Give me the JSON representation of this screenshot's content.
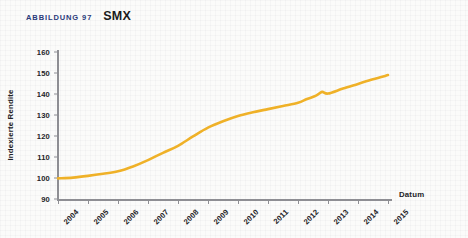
{
  "figure": {
    "kicker": "ABBILDUNG 97",
    "title": "SMX"
  },
  "colors": {
    "series": "#efb128",
    "kicker": "#2b3a7a",
    "axis": "#8e8e93",
    "text": "#232327",
    "background": "#fbfbfa"
  },
  "chart_data": {
    "type": "line",
    "title": "SMX",
    "xlabel": "Datum",
    "ylabel": "Indexierte Rendite",
    "xlim": [
      2004,
      2015
    ],
    "ylim": [
      90,
      160
    ],
    "ytick_labels": [
      "160",
      "150",
      "140",
      "130",
      "120",
      "110",
      "100",
      "90"
    ],
    "yticks": [
      160,
      150,
      140,
      130,
      120,
      110,
      100,
      90
    ],
    "xtick_labels": [
      "2004",
      "2005",
      "2006",
      "2007",
      "2008",
      "2009",
      "2010",
      "2011",
      "2012",
      "2013",
      "2014",
      "2015"
    ],
    "xticks": [
      2004,
      2005,
      2006,
      2007,
      2008,
      2009,
      2010,
      2011,
      2012,
      2013,
      2014,
      2015
    ],
    "grid": false,
    "legend": false,
    "series": [
      {
        "name": "SMX",
        "color": "#efb128",
        "x": [
          2004,
          2004.5,
          2005,
          2005.5,
          2006,
          2006.5,
          2007,
          2007.5,
          2008,
          2008.5,
          2009,
          2009.5,
          2010,
          2010.5,
          2011,
          2011.5,
          2012,
          2012.3,
          2012.6,
          2012.8,
          2013,
          2013.5,
          2014,
          2014.5,
          2015
        ],
        "y": [
          99.8,
          100.2,
          101.0,
          102.0,
          103.2,
          105.5,
          108.5,
          112.0,
          115.3,
          119.8,
          124.0,
          127.0,
          129.5,
          131.3,
          132.8,
          134.3,
          135.8,
          137.6,
          139.2,
          141.0,
          140.2,
          142.6,
          144.8,
          147.0,
          149.0
        ]
      }
    ]
  }
}
